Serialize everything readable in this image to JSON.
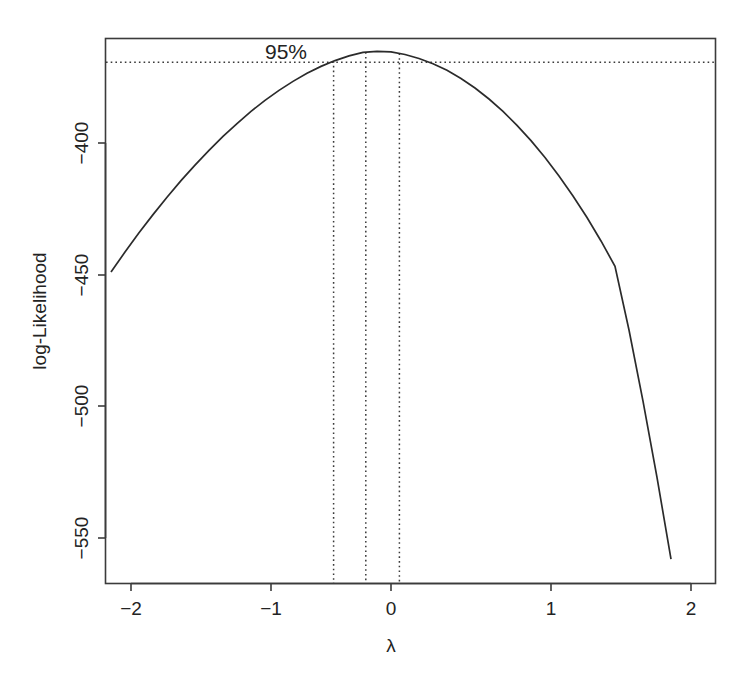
{
  "chart_data": {
    "type": "line",
    "title": "",
    "subtitle": "",
    "xlabel": "λ",
    "ylabel": "log-Likelihood",
    "xlim": [
      -2.0,
      2.0
    ],
    "ylim": [
      -562,
      -363
    ],
    "grid": false,
    "legend": null,
    "x_ticks": [
      -2,
      -1,
      0,
      1,
      2
    ],
    "x_tick_labels": [
      "−2",
      "−1",
      "0",
      "1",
      "2"
    ],
    "y_ticks": [
      -400,
      -450,
      -500,
      -550
    ],
    "y_tick_labels": [
      "−400",
      "−450",
      "−500",
      "−550"
    ],
    "series": [
      {
        "name": "log-likelihood profile",
        "x": [
          -2.0,
          -1.9,
          -1.8,
          -1.7,
          -1.6,
          -1.5,
          -1.4,
          -1.3,
          -1.2,
          -1.1,
          -1.0,
          -0.9,
          -0.8,
          -0.7,
          -0.6,
          -0.5,
          -0.4,
          -0.3,
          -0.2,
          -0.1,
          0.0,
          0.1,
          0.2,
          0.3,
          0.4,
          0.5,
          0.6,
          0.7,
          0.8,
          0.9,
          1.0,
          1.1,
          1.2,
          1.3,
          1.4,
          1.5,
          1.6,
          1.7,
          1.8,
          1.9,
          2.0
        ],
        "y": [
          -449.0,
          -441.4,
          -434.1,
          -427.2,
          -420.6,
          -414.3,
          -408.4,
          -402.8,
          -397.5,
          -392.6,
          -388.0,
          -383.8,
          -380.0,
          -376.6,
          -373.5,
          -370.9,
          -368.7,
          -366.9,
          -365.6,
          -365.2,
          -365.4,
          -366.4,
          -367.9,
          -369.9,
          -372.4,
          -375.5,
          -379.1,
          -383.3,
          -388.0,
          -393.3,
          -399.1,
          -405.5,
          -412.5,
          -420.1,
          -428.3,
          -437.2,
          -446.8,
          -471.0,
          -498.0,
          -527.0,
          -558.0
        ]
      }
    ],
    "annotations": [
      {
        "name": "confidence-level-label",
        "text": "95%",
        "x": -0.9,
        "y": -368.0
      }
    ],
    "reference_lines": {
      "horizontal": [
        {
          "name": "ci-threshold-line",
          "value": -369.3,
          "style": "dotted",
          "label": "95%"
        }
      ],
      "vertical": [
        {
          "name": "ci-lower-line",
          "value": -0.41,
          "style": "dotted"
        },
        {
          "name": "mle-line",
          "value": -0.18,
          "style": "dotted"
        },
        {
          "name": "ci-upper-line",
          "value": 0.06,
          "style": "dotted"
        }
      ]
    },
    "max_log_likelihood": -365.1,
    "mle_lambda": -0.18,
    "ci_lower_lambda": -0.41,
    "ci_upper_lambda": 0.06,
    "colors": {
      "curve": "#2b2b2b",
      "axis": "#3b3b3b",
      "dotted": "#3a3a3a",
      "text": "#232323",
      "background": "#ffffff"
    }
  }
}
